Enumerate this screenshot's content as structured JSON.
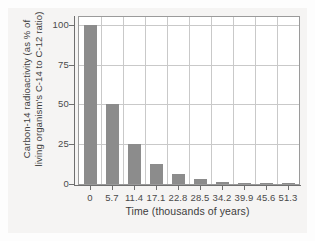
{
  "chart_data": {
    "type": "bar",
    "title": "",
    "xlabel": "Time (thousands of years)",
    "ylabel_line1": "Carbon-14 radioactivity (as % of",
    "ylabel_line2": "living organism's C-14 to C-12 ratio)",
    "categories": [
      "0",
      "5.7",
      "11.4",
      "17.1",
      "22.8",
      "28.5",
      "34.2",
      "39.9",
      "45.6",
      "51.3"
    ],
    "values": [
      100,
      50,
      25,
      12.5,
      6.25,
      3.125,
      1.5625,
      0.78125,
      0.390625,
      0.1953125
    ],
    "x_tick_labels": [
      "0",
      "5.7",
      "11.4",
      "17.1",
      "22.8",
      "28.5",
      "34.2",
      "39.9",
      "45.6",
      "51.3"
    ],
    "y_tick_labels": [
      "100",
      "75",
      "50",
      "25",
      "0"
    ],
    "y_tick_values": [
      100,
      75,
      50,
      25,
      0
    ],
    "ylim": [
      0,
      105
    ],
    "grid": "vertical-and-horizontal",
    "legend": "none",
    "bar_color": "#8c8c8c",
    "grid_color": "#c9c9c9",
    "axis_color": "#6f6f6f",
    "plot_background": "#ffffff",
    "figure_background": "#f5f4f3"
  }
}
